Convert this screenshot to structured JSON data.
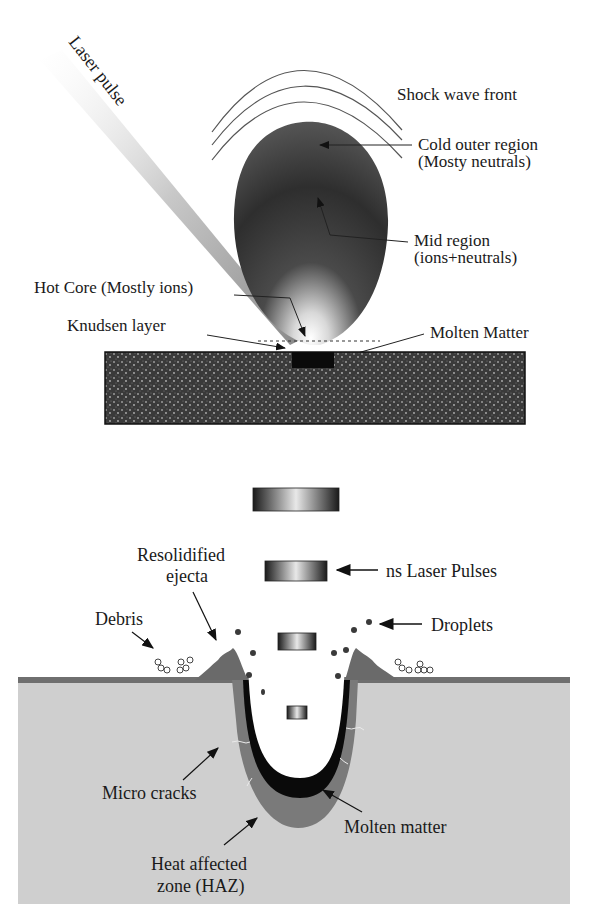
{
  "top_panel": {
    "laser_pulse": "Laser pulse",
    "shock_wave": "Shock wave front",
    "cold_outer_1": "Cold outer region",
    "cold_outer_2": "(Mosty neutrals)",
    "mid_region_1": "Mid region",
    "mid_region_2": "(ions+neutrals)",
    "hot_core": "Hot Core (Mostly ions)",
    "knudsen": "Knudsen layer",
    "molten_matter": "Molten Matter"
  },
  "bottom_panel": {
    "resolidified_1": "Resolidified",
    "resolidified_2": "ejecta",
    "ns_pulses": "ns Laser Pulses",
    "debris": "Debris",
    "droplets": "Droplets",
    "micro_cracks": "Micro cracks",
    "molten_matter": "Molten matter",
    "haz_1": "Heat affected",
    "haz_2": "zone (HAZ)"
  },
  "colors": {
    "plume_dark": "#2a2a2a",
    "substrate": "#3a3a3a",
    "bulk": "#cfcfcf",
    "haz": "#7a7a7a",
    "molten": "#0a0a0a"
  }
}
